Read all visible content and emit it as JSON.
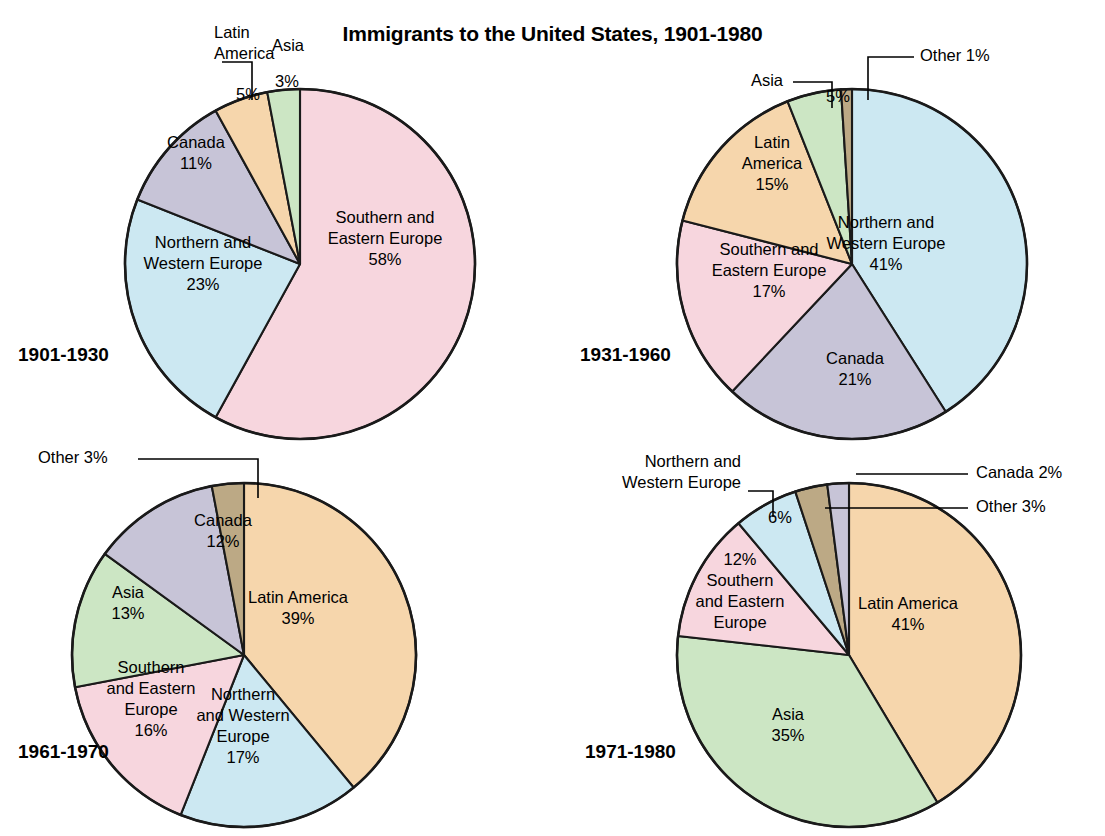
{
  "title": "Immigrants to the United States, 1901-1980",
  "colors": {
    "southern_eastern_europe": "#F7D6DE",
    "northern_western_europe": "#CCE8F2",
    "canada": "#C7C4D7",
    "latin_america": "#F6D6AC",
    "asia": "#CCE6C4",
    "other": "#BCA985",
    "outline": "#1a1a1a",
    "text": "#000000",
    "background": "#ffffff"
  },
  "chart_data": [
    {
      "type": "pie",
      "title": "1901-1930",
      "legend": "none",
      "start_angle_deg": 0,
      "direction": "clockwise",
      "categories": [
        "Southern and Eastern Europe",
        "Northern and Western Europe",
        "Canada",
        "Latin America",
        "Asia"
      ],
      "values": [
        58,
        23,
        11,
        5,
        3
      ],
      "units": "percent",
      "slices": [
        {
          "label": "Southern and\nEastern Europe",
          "value": 58,
          "value_text": "58%",
          "color_key": "southern_eastern_europe",
          "label_placement": "inside"
        },
        {
          "label": "Northern and\nWestern Europe",
          "value": 23,
          "value_text": "23%",
          "color_key": "northern_western_europe",
          "label_placement": "inside"
        },
        {
          "label": "Canada",
          "value": 11,
          "value_text": "11%",
          "color_key": "canada",
          "label_placement": "inside"
        },
        {
          "label": "Latin\nAmerica",
          "value": 5,
          "value_text": "5%",
          "color_key": "latin_america",
          "label_placement": "callout"
        },
        {
          "label": "Asia",
          "value": 3,
          "value_text": "3%",
          "color_key": "asia",
          "label_placement": "callout"
        }
      ]
    },
    {
      "type": "pie",
      "title": "1931-1960",
      "legend": "none",
      "start_angle_deg": 0,
      "direction": "clockwise",
      "categories": [
        "Northern and Western Europe",
        "Canada",
        "Southern and Eastern Europe",
        "Latin America",
        "Asia",
        "Other"
      ],
      "values": [
        41,
        21,
        17,
        15,
        5,
        1
      ],
      "units": "percent",
      "slices": [
        {
          "label": "Northern and\nWestern Europe",
          "value": 41,
          "value_text": "41%",
          "color_key": "northern_western_europe",
          "label_placement": "inside"
        },
        {
          "label": "Canada",
          "value": 21,
          "value_text": "21%",
          "color_key": "canada",
          "label_placement": "inside"
        },
        {
          "label": "Southern and\nEastern Europe",
          "value": 17,
          "value_text": "17%",
          "color_key": "southern_eastern_europe",
          "label_placement": "inside"
        },
        {
          "label": "Latin\nAmerica",
          "value": 15,
          "value_text": "15%",
          "color_key": "latin_america",
          "label_placement": "inside"
        },
        {
          "label": "Asia",
          "value": 5,
          "value_text": "5%",
          "color_key": "asia",
          "label_placement": "callout"
        },
        {
          "label": "Other",
          "value": 1,
          "value_text": "1%",
          "color_key": "other",
          "label_placement": "callout"
        }
      ]
    },
    {
      "type": "pie",
      "title": "1961-1970",
      "legend": "none",
      "start_angle_deg": 0,
      "direction": "clockwise",
      "categories": [
        "Latin America",
        "Northern and Western Europe",
        "Southern and Eastern Europe",
        "Asia",
        "Canada",
        "Other"
      ],
      "values": [
        39,
        17,
        16,
        13,
        12,
        3
      ],
      "units": "percent",
      "slices": [
        {
          "label": "Latin America",
          "value": 39,
          "value_text": "39%",
          "color_key": "latin_america",
          "label_placement": "inside"
        },
        {
          "label": "Northern\nand Western\nEurope",
          "value": 17,
          "value_text": "17%",
          "color_key": "northern_western_europe",
          "label_placement": "inside"
        },
        {
          "label": "Southern\nand Eastern\nEurope",
          "value": 16,
          "value_text": "16%",
          "color_key": "southern_eastern_europe",
          "label_placement": "inside"
        },
        {
          "label": "Asia",
          "value": 13,
          "value_text": "13%",
          "color_key": "asia",
          "label_placement": "inside"
        },
        {
          "label": "Canada",
          "value": 12,
          "value_text": "12%",
          "color_key": "canada",
          "label_placement": "inside"
        },
        {
          "label": "Other",
          "value": 3,
          "value_text": "3%",
          "color_key": "other",
          "label_placement": "callout"
        }
      ]
    },
    {
      "type": "pie",
      "title": "1971-1980",
      "legend": "none",
      "start_angle_deg": 0,
      "direction": "clockwise",
      "categories": [
        "Latin America",
        "Asia",
        "Southern and Eastern Europe",
        "Northern and Western Europe",
        "Other",
        "Canada"
      ],
      "values": [
        41,
        35,
        12,
        6,
        3,
        2
      ],
      "units": "percent",
      "slices": [
        {
          "label": "Latin America",
          "value": 41,
          "value_text": "41%",
          "color_key": "latin_america",
          "label_placement": "inside"
        },
        {
          "label": "Asia",
          "value": 35,
          "value_text": "35%",
          "color_key": "asia",
          "label_placement": "inside"
        },
        {
          "label": "Southern\nand Eastern\nEurope",
          "value": 12,
          "value_text": "12%",
          "color_key": "southern_eastern_europe",
          "label_placement": "inside"
        },
        {
          "label": "Northern and\nWestern Europe",
          "value": 6,
          "value_text": "6%",
          "color_key": "northern_western_europe",
          "label_placement": "callout"
        },
        {
          "label": "Other",
          "value": 3,
          "value_text": "3%",
          "color_key": "other",
          "label_placement": "callout"
        },
        {
          "label": "Canada",
          "value": 2,
          "value_text": "2%",
          "color_key": "canada",
          "label_placement": "callout"
        }
      ]
    }
  ],
  "panels": [
    {
      "period": "1901-1930",
      "period_label_pos": {
        "x": 18,
        "y": 355
      },
      "inside_labels": [
        {
          "name": "southern-eastern-europe",
          "x": 385,
          "y": 240,
          "lines": [
            "Southern and",
            "Eastern Europe",
            "58%"
          ]
        },
        {
          "name": "northern-western-europe",
          "x": 203,
          "y": 265,
          "lines": [
            "Northern and",
            "Western Europe",
            "23%"
          ]
        },
        {
          "name": "canada",
          "x": 196,
          "y": 154,
          "lines": [
            "Canada",
            "11%"
          ]
        },
        {
          "name": "latin-america-value",
          "x": 248,
          "y": 96,
          "lines": [
            "5%"
          ]
        },
        {
          "name": "asia-value",
          "x": 287,
          "y": 83,
          "lines": [
            "3%"
          ]
        }
      ],
      "callouts": [
        {
          "name": "latin-america",
          "align": "left",
          "x": 214,
          "y": 44,
          "lines": [
            "Latin",
            "America"
          ],
          "leader": "M 222,62 L 252,62 L 252,100"
        },
        {
          "name": "asia",
          "align": "middle",
          "x": 288,
          "y": 47,
          "lines": [
            "Asia"
          ],
          "leader": ""
        }
      ]
    },
    {
      "period": "1931-1960",
      "period_label_pos": {
        "x": 580,
        "y": 355
      },
      "inside_labels": [
        {
          "name": "northern-western-europe",
          "x": 886,
          "y": 245,
          "lines": [
            "Northern and",
            "Western Europe",
            "41%"
          ]
        },
        {
          "name": "canada",
          "x": 855,
          "y": 370,
          "lines": [
            "Canada",
            "21%"
          ]
        },
        {
          "name": "southern-eastern-europe",
          "x": 769,
          "y": 272,
          "lines": [
            "Southern and",
            "Eastern Europe",
            "17%"
          ]
        },
        {
          "name": "latin-america",
          "x": 772,
          "y": 165,
          "lines": [
            "Latin",
            "America",
            "15%"
          ]
        },
        {
          "name": "asia-value",
          "x": 838,
          "y": 98,
          "lines": [
            "5%"
          ]
        }
      ],
      "callouts": [
        {
          "name": "asia",
          "align": "right",
          "x": 783,
          "y": 82,
          "lines": [
            "Asia"
          ],
          "leader": "M 793,82 L 832,82 L 832,108"
        },
        {
          "name": "other",
          "align": "left",
          "x": 920,
          "y": 57,
          "lines": [
            "Other  1%"
          ],
          "leader": "M 914,57 L 868,57 L 868,100"
        }
      ]
    },
    {
      "period": "1961-1970",
      "period_label_pos": {
        "x": 18,
        "y": 752
      },
      "inside_labels": [
        {
          "name": "latin-america",
          "x": 298,
          "y": 609,
          "lines": [
            "Latin America",
            "39%"
          ]
        },
        {
          "name": "northern-western-europe",
          "x": 243,
          "y": 727,
          "lines": [
            "Northern",
            "and Western",
            "Europe",
            "17%"
          ]
        },
        {
          "name": "southern-eastern-europe",
          "x": 151,
          "y": 700,
          "lines": [
            "Southern",
            "and Eastern",
            "Europe",
            "16%"
          ]
        },
        {
          "name": "asia",
          "x": 128,
          "y": 604,
          "lines": [
            "Asia",
            "13%"
          ]
        },
        {
          "name": "canada",
          "x": 223,
          "y": 532,
          "lines": [
            "Canada",
            "12%"
          ]
        }
      ],
      "callouts": [
        {
          "name": "other",
          "align": "left",
          "x": 38,
          "y": 459,
          "lines": [
            "Other  3%"
          ],
          "leader": "M 138,459 L 258,459 L 258,498"
        }
      ]
    },
    {
      "period": "1971-1980",
      "period_label_pos": {
        "x": 585,
        "y": 752
      },
      "inside_labels": [
        {
          "name": "latin-america",
          "x": 908,
          "y": 615,
          "lines": [
            "Latin America",
            "41%"
          ]
        },
        {
          "name": "asia",
          "x": 788,
          "y": 726,
          "lines": [
            "Asia",
            "35%"
          ]
        },
        {
          "name": "southern-eastern-europe",
          "x": 740,
          "y": 592,
          "lines": [
            "12%",
            "Southern",
            "and Eastern",
            "Europe"
          ]
        },
        {
          "name": "northern-western-europe-value",
          "x": 780,
          "y": 519,
          "lines": [
            "6%"
          ]
        }
      ],
      "callouts": [
        {
          "name": "northern-western-europe",
          "align": "right",
          "x": 741,
          "y": 473,
          "lines": [
            "Northern and",
            "Western Europe"
          ],
          "leader": "M 748,491 L 773,491 L 773,517"
        },
        {
          "name": "canada",
          "align": "left",
          "x": 976,
          "y": 474,
          "lines": [
            "Canada 2%"
          ],
          "leader": "M 968,474 L 856,474"
        },
        {
          "name": "other",
          "align": "left",
          "x": 976,
          "y": 508,
          "lines": [
            "Other 3%"
          ],
          "leader": "M 968,508 L 825,508"
        }
      ]
    }
  ],
  "geometry": {
    "pies": [
      {
        "cx": 300,
        "cy": 264,
        "r": 175,
        "rotation_deg": 0
      },
      {
        "cx": 852,
        "cy": 264,
        "r": 175,
        "rotation_deg": 0
      },
      {
        "cx": 244,
        "cy": 655,
        "r": 172,
        "rotation_deg": 0
      },
      {
        "cx": 849,
        "cy": 655,
        "r": 172,
        "rotation_deg": 0
      }
    ]
  }
}
